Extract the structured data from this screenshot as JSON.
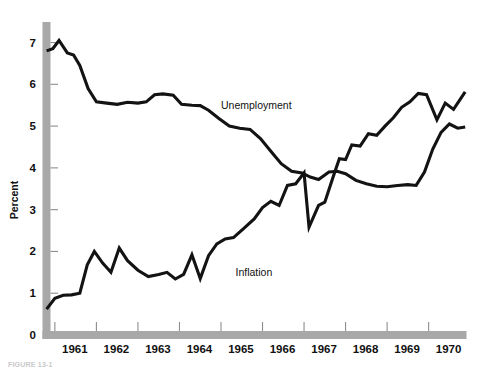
{
  "figure": {
    "caption": "FIGURE 13-1",
    "ylabel": "Percent"
  },
  "chart_data": {
    "type": "line",
    "title": "",
    "xlabel": "",
    "ylabel": "Percent",
    "ylim": [
      0,
      7.3
    ],
    "xlim": [
      1960.75,
      1970.9
    ],
    "grid": false,
    "legend": "inline-annotations",
    "yticks": [
      0,
      1,
      2,
      3,
      4,
      5,
      6,
      7
    ],
    "ytick_labels": [
      "0",
      "1",
      "2",
      "3",
      "4",
      "5",
      "6",
      "7"
    ],
    "xticks": [
      1961,
      1962,
      1963,
      1964,
      1965,
      1966,
      1967,
      1968,
      1969,
      1970
    ],
    "xtick_labels": [
      "1961",
      "1962",
      "1963",
      "1964",
      "1965",
      "1966",
      "1967",
      "1968",
      "1969",
      "1970"
    ],
    "series": [
      {
        "name": "Unemployment",
        "label": "Unemployment",
        "color": "#131313",
        "points": [
          [
            1960.8,
            6.8
          ],
          [
            1960.95,
            6.85
          ],
          [
            1961.1,
            7.05
          ],
          [
            1961.3,
            6.75
          ],
          [
            1961.45,
            6.7
          ],
          [
            1961.6,
            6.45
          ],
          [
            1961.8,
            5.9
          ],
          [
            1962.0,
            5.58
          ],
          [
            1962.25,
            5.55
          ],
          [
            1962.5,
            5.52
          ],
          [
            1962.75,
            5.57
          ],
          [
            1963.0,
            5.55
          ],
          [
            1963.2,
            5.58
          ],
          [
            1963.4,
            5.75
          ],
          [
            1963.6,
            5.77
          ],
          [
            1963.85,
            5.74
          ],
          [
            1964.05,
            5.52
          ],
          [
            1964.3,
            5.5
          ],
          [
            1964.5,
            5.49
          ],
          [
            1964.7,
            5.38
          ],
          [
            1964.95,
            5.18
          ],
          [
            1965.2,
            5.0
          ],
          [
            1965.45,
            4.95
          ],
          [
            1965.7,
            4.92
          ],
          [
            1965.95,
            4.7
          ],
          [
            1966.2,
            4.4
          ],
          [
            1966.45,
            4.1
          ],
          [
            1966.7,
            3.92
          ],
          [
            1966.95,
            3.88
          ],
          [
            1967.15,
            3.78
          ],
          [
            1967.35,
            3.72
          ],
          [
            1967.6,
            3.9
          ],
          [
            1967.8,
            3.92
          ],
          [
            1968.0,
            3.86
          ],
          [
            1968.25,
            3.7
          ],
          [
            1968.5,
            3.62
          ],
          [
            1968.75,
            3.56
          ],
          [
            1969.0,
            3.55
          ],
          [
            1969.25,
            3.58
          ],
          [
            1969.5,
            3.6
          ],
          [
            1969.7,
            3.58
          ],
          [
            1969.9,
            3.9
          ],
          [
            1970.1,
            4.45
          ],
          [
            1970.3,
            4.85
          ],
          [
            1970.5,
            5.05
          ],
          [
            1970.7,
            4.95
          ],
          [
            1970.88,
            4.98
          ]
        ]
      },
      {
        "name": "Inflation",
        "label": "Inflation",
        "color": "#131313",
        "points": [
          [
            1960.8,
            0.62
          ],
          [
            1961.0,
            0.88
          ],
          [
            1961.2,
            0.95
          ],
          [
            1961.4,
            0.96
          ],
          [
            1961.6,
            1.0
          ],
          [
            1961.78,
            1.68
          ],
          [
            1961.95,
            2.0
          ],
          [
            1962.15,
            1.72
          ],
          [
            1962.35,
            1.5
          ],
          [
            1962.55,
            2.08
          ],
          [
            1962.75,
            1.78
          ],
          [
            1963.0,
            1.55
          ],
          [
            1963.25,
            1.4
          ],
          [
            1963.5,
            1.45
          ],
          [
            1963.7,
            1.5
          ],
          [
            1963.9,
            1.34
          ],
          [
            1964.1,
            1.45
          ],
          [
            1964.3,
            1.92
          ],
          [
            1964.5,
            1.35
          ],
          [
            1964.7,
            1.9
          ],
          [
            1964.9,
            2.18
          ],
          [
            1965.1,
            2.3
          ],
          [
            1965.3,
            2.33
          ],
          [
            1965.55,
            2.55
          ],
          [
            1965.8,
            2.78
          ],
          [
            1966.0,
            3.05
          ],
          [
            1966.2,
            3.2
          ],
          [
            1966.4,
            3.1
          ],
          [
            1966.6,
            3.58
          ],
          [
            1966.8,
            3.62
          ],
          [
            1967.0,
            3.88
          ],
          [
            1967.12,
            2.58
          ],
          [
            1967.35,
            3.1
          ],
          [
            1967.5,
            3.18
          ],
          [
            1967.7,
            3.78
          ],
          [
            1967.85,
            4.22
          ],
          [
            1968.0,
            4.2
          ],
          [
            1968.15,
            4.55
          ],
          [
            1968.35,
            4.52
          ],
          [
            1968.55,
            4.82
          ],
          [
            1968.75,
            4.78
          ],
          [
            1968.95,
            5.0
          ],
          [
            1969.15,
            5.2
          ],
          [
            1969.35,
            5.45
          ],
          [
            1969.55,
            5.58
          ],
          [
            1969.75,
            5.78
          ],
          [
            1969.95,
            5.75
          ],
          [
            1970.2,
            5.15
          ],
          [
            1970.4,
            5.55
          ],
          [
            1970.6,
            5.4
          ],
          [
            1970.88,
            5.82
          ]
        ]
      }
    ],
    "annotations": [
      {
        "text": "Unemployment",
        "x": 1965.0,
        "y": 5.42
      },
      {
        "text": "Inflation",
        "x": 1965.35,
        "y": 1.42
      }
    ]
  }
}
